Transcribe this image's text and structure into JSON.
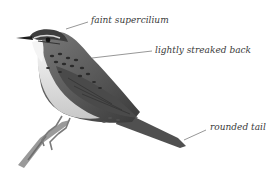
{
  "illustration": {
    "subject": "bird-illustration",
    "annotations": [
      {
        "text": "faint supercilium",
        "x": 91,
        "y": 17
      },
      {
        "text": "lightly streaked back",
        "x": 155,
        "y": 46
      },
      {
        "text": "rounded tail",
        "x": 210,
        "y": 124
      }
    ]
  }
}
